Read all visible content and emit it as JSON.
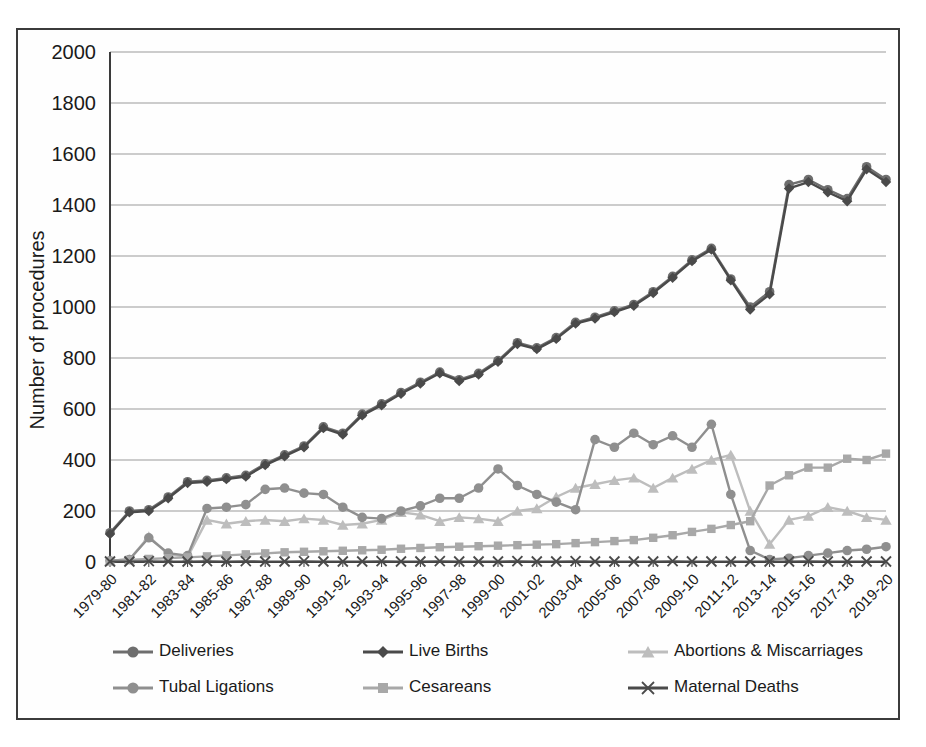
{
  "chart_data": {
    "type": "line",
    "title": "",
    "xlabel": "",
    "ylabel": "Number of procedures",
    "ylim": [
      0,
      2000
    ],
    "ytick_step": 200,
    "yticks": [
      0,
      200,
      400,
      600,
      800,
      1000,
      1200,
      1400,
      1600,
      1800,
      2000
    ],
    "grid": true,
    "legend_position": "bottom",
    "xtick_label_interval": 2,
    "categories": [
      "1979-80",
      "1980-81",
      "1981-82",
      "1982-83",
      "1983-84",
      "1984-85",
      "1985-86",
      "1986-87",
      "1987-88",
      "1988-89",
      "1989-90",
      "1990-91",
      "1991-92",
      "1992-93",
      "1993-94",
      "1994-95",
      "1995-96",
      "1996-97",
      "1997-98",
      "1998-99",
      "1999-00",
      "2000-01",
      "2001-02",
      "2002-03",
      "2003-04",
      "2004-05",
      "2005-06",
      "2006-07",
      "2007-08",
      "2008-09",
      "2009-10",
      "2010-11",
      "2011-12",
      "2012-13",
      "2013-14",
      "2014-15",
      "2015-16",
      "2016-17",
      "2017-18",
      "2018-19",
      "2019-20"
    ],
    "xtick_labels": [
      "1979-80",
      "1981-82",
      "1983-84",
      "1985-86",
      "1987-88",
      "1989-90",
      "1991-92",
      "1993-94",
      "1995-96",
      "1997-98",
      "1999-00",
      "2001-02",
      "2003-04",
      "2005-06",
      "2007-08",
      "2009-10",
      "2011-12",
      "2013-14",
      "2015-16",
      "2017-18",
      "2019-20"
    ],
    "series": [
      {
        "name": "Deliveries",
        "marker": "circle",
        "color": "#6e6e6e",
        "values": [
          115,
          200,
          205,
          255,
          315,
          320,
          330,
          340,
          385,
          420,
          455,
          530,
          505,
          580,
          620,
          665,
          705,
          745,
          715,
          740,
          790,
          860,
          840,
          880,
          940,
          960,
          985,
          1010,
          1060,
          1120,
          1185,
          1230,
          1110,
          1000,
          1060,
          1480,
          1500,
          1460,
          1425,
          1550,
          1500
        ]
      },
      {
        "name": "Live Births",
        "marker": "diamond",
        "color": "#4a4a4a",
        "values": [
          110,
          195,
          200,
          250,
          310,
          315,
          325,
          335,
          380,
          415,
          450,
          525,
          500,
          575,
          615,
          660,
          700,
          740,
          710,
          735,
          785,
          855,
          835,
          875,
          935,
          955,
          980,
          1005,
          1055,
          1115,
          1180,
          1225,
          1105,
          990,
          1050,
          1465,
          1490,
          1450,
          1415,
          1540,
          1490
        ]
      },
      {
        "name": "Abortions & Miscarriages",
        "marker": "triangle",
        "color": "#bdbdbd",
        "values": [
          5,
          10,
          100,
          30,
          20,
          165,
          150,
          160,
          165,
          160,
          170,
          165,
          145,
          150,
          165,
          195,
          185,
          160,
          175,
          170,
          160,
          200,
          210,
          255,
          290,
          305,
          320,
          330,
          290,
          330,
          365,
          400,
          420,
          200,
          70,
          165,
          180,
          215,
          200,
          175,
          165
        ]
      },
      {
        "name": "Tubal Ligations",
        "marker": "circle",
        "color": "#8f8f8f",
        "values": [
          5,
          10,
          95,
          35,
          25,
          210,
          215,
          225,
          285,
          290,
          270,
          265,
          215,
          175,
          170,
          200,
          220,
          250,
          250,
          290,
          365,
          300,
          265,
          235,
          205,
          480,
          450,
          505,
          460,
          495,
          450,
          540,
          265,
          45,
          10,
          8,
          10,
          12,
          15,
          18,
          20
        ]
      },
      {
        "name": "Cesareans",
        "marker": "square",
        "color": "#a8a8a8",
        "values": [
          3,
          8,
          12,
          15,
          18,
          22,
          26,
          30,
          34,
          38,
          40,
          42,
          44,
          46,
          48,
          52,
          55,
          58,
          60,
          62,
          64,
          66,
          68,
          70,
          74,
          78,
          82,
          86,
          95,
          105,
          118,
          130,
          145,
          160,
          175,
          190,
          205,
          215,
          225,
          240,
          250
        ]
      },
      {
        "name": "Maternal Deaths",
        "marker": "x",
        "color": "#4a4a4a",
        "values": [
          2,
          2,
          3,
          2,
          2,
          3,
          2,
          3,
          2,
          2,
          3,
          2,
          2,
          2,
          3,
          2,
          2,
          3,
          2,
          2,
          2,
          3,
          2,
          2,
          3,
          2,
          2,
          2,
          2,
          3,
          2,
          2,
          2,
          2,
          2,
          2,
          3,
          2,
          2,
          2,
          2
        ]
      }
    ],
    "series_overrides": {
      "Tubal Ligations_late": [
        {
          "index": 32,
          "value": 265
        },
        {
          "index": 33,
          "value": 45
        },
        {
          "index": 34,
          "value": 10
        },
        {
          "index": 35,
          "value": 15
        },
        {
          "index": 36,
          "value": 25
        },
        {
          "index": 37,
          "value": 35
        },
        {
          "index": 38,
          "value": 45
        },
        {
          "index": 39,
          "value": 50
        },
        {
          "index": 40,
          "value": 60
        }
      ],
      "Cesareans_late": [
        {
          "index": 34,
          "value": 300
        },
        {
          "index": 35,
          "value": 340
        },
        {
          "index": 36,
          "value": 370
        },
        {
          "index": 37,
          "value": 370
        },
        {
          "index": 38,
          "value": 405
        },
        {
          "index": 39,
          "value": 400
        },
        {
          "index": 40,
          "value": 425
        }
      ]
    }
  },
  "legend": {
    "entries": [
      {
        "label": "Deliveries",
        "marker": "circle",
        "color": "#6e6e6e"
      },
      {
        "label": "Live Births",
        "marker": "diamond",
        "color": "#4a4a4a"
      },
      {
        "label": "Abortions & Miscarriages",
        "marker": "triangle",
        "color": "#bdbdbd"
      },
      {
        "label": "Tubal Ligations",
        "marker": "circle",
        "color": "#8f8f8f"
      },
      {
        "label": "Cesareans",
        "marker": "square",
        "color": "#a8a8a8"
      },
      {
        "label": "Maternal Deaths",
        "marker": "x",
        "color": "#4a4a4a"
      }
    ]
  }
}
